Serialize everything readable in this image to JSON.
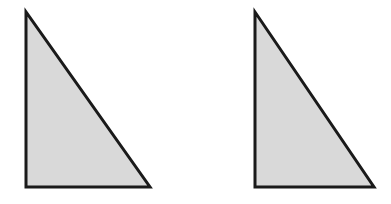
{
  "canvas": {
    "width": 391,
    "height": 204,
    "background_color": "#ffffff"
  },
  "figure": {
    "shape_count": 2,
    "fill_color": "#d9d9d9",
    "stroke_color": "#1a1a1a",
    "stroke_width": 3
  },
  "shapes": [
    {
      "name": "right-triangle-left",
      "type": "triangle",
      "right_angle_corner": "bottom-left",
      "points": "26,12 26,187 150,187",
      "vertices": {
        "apex": [
          26,
          12
        ],
        "bottom_left": [
          26,
          187
        ],
        "bottom_right": [
          150,
          187
        ]
      },
      "width": 124,
      "height": 175,
      "fill": "#d9d9d9",
      "stroke": "#1a1a1a",
      "stroke_width": 3
    },
    {
      "name": "right-triangle-right",
      "type": "triangle",
      "right_angle_corner": "bottom-left",
      "points": "255,12 255,187 374,187",
      "vertices": {
        "apex": [
          255,
          12
        ],
        "bottom_left": [
          255,
          187
        ],
        "bottom_right": [
          374,
          187
        ]
      },
      "width": 119,
      "height": 175,
      "fill": "#d9d9d9",
      "stroke": "#1a1a1a",
      "stroke_width": 3
    }
  ]
}
